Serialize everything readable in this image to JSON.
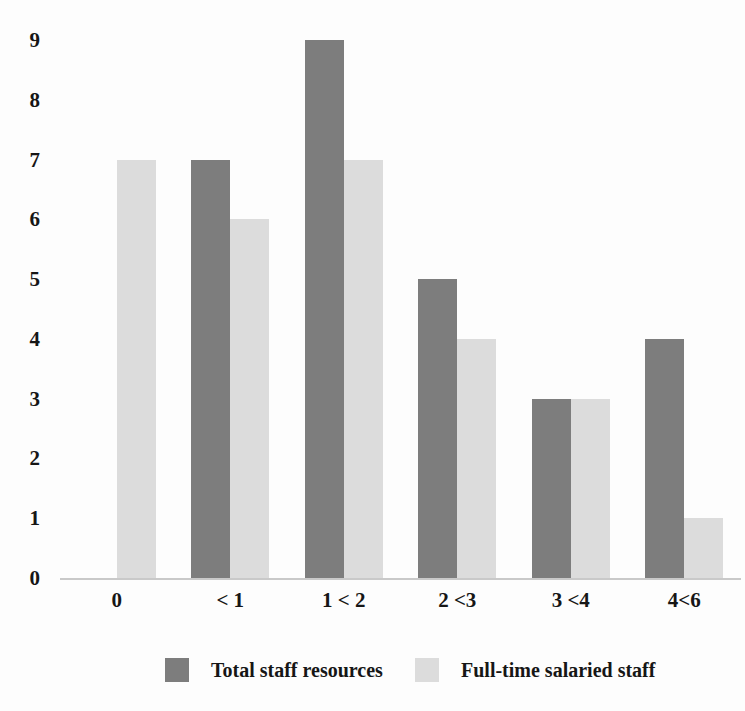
{
  "chart_data": {
    "type": "bar",
    "title": "",
    "subtitle": "",
    "xlabel": "",
    "ylabel": "",
    "categories": [
      "0",
      "< 1",
      "1 < 2",
      "2 <3",
      "3 <4",
      "4<6"
    ],
    "series": [
      {
        "name": "Total staff resources",
        "color": "#7d7d7d",
        "values": [
          0,
          7,
          9,
          5,
          3,
          4
        ]
      },
      {
        "name": "Full-time salaried staff",
        "color": "#dcdcdc",
        "values": [
          7,
          6,
          7,
          4,
          3,
          1
        ]
      }
    ],
    "ylim": [
      0,
      9
    ],
    "yticks": [
      0,
      1,
      2,
      3,
      4,
      5,
      6,
      7,
      8,
      9
    ],
    "ytick_labels": [
      "0",
      "1",
      "2",
      "3",
      "4",
      "5",
      "6",
      "7",
      "8",
      "9"
    ],
    "grid": false,
    "legend_position": "bottom",
    "background": "#fdfdfd",
    "axis_color": "#c9c9c9"
  }
}
